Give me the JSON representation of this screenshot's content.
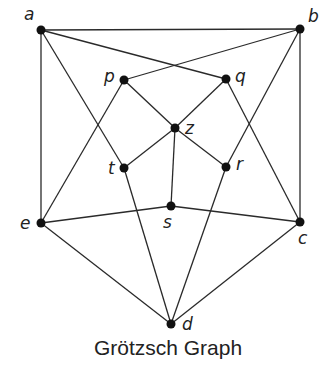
{
  "title": "Grötzsch Graph",
  "nodes": [
    {
      "id": "a",
      "x": 41,
      "y": 30,
      "lx": 24,
      "ly": 20
    },
    {
      "id": "b",
      "x": 300,
      "y": 29,
      "lx": 308,
      "ly": 22
    },
    {
      "id": "p",
      "x": 124,
      "y": 80,
      "lx": 104,
      "ly": 82
    },
    {
      "id": "q",
      "x": 226,
      "y": 79,
      "lx": 235,
      "ly": 82
    },
    {
      "id": "z",
      "x": 175,
      "y": 128,
      "lx": 185,
      "ly": 134
    },
    {
      "id": "t",
      "x": 124,
      "y": 168,
      "lx": 108,
      "ly": 174
    },
    {
      "id": "r",
      "x": 226,
      "y": 167,
      "lx": 236,
      "ly": 170
    },
    {
      "id": "s",
      "x": 171,
      "y": 206,
      "lx": 163,
      "ly": 228
    },
    {
      "id": "e",
      "x": 41,
      "y": 223,
      "lx": 20,
      "ly": 229
    },
    {
      "id": "c",
      "x": 300,
      "y": 222,
      "lx": 298,
      "ly": 244
    },
    {
      "id": "d",
      "x": 171,
      "y": 324,
      "lx": 182,
      "ly": 330
    }
  ],
  "edges": [
    [
      "a",
      "b"
    ],
    [
      "a",
      "e"
    ],
    [
      "a",
      "q"
    ],
    [
      "a",
      "t"
    ],
    [
      "b",
      "p"
    ],
    [
      "b",
      "c"
    ],
    [
      "b",
      "r"
    ],
    [
      "p",
      "z"
    ],
    [
      "p",
      "e"
    ],
    [
      "q",
      "z"
    ],
    [
      "q",
      "c"
    ],
    [
      "t",
      "z"
    ],
    [
      "t",
      "d"
    ],
    [
      "r",
      "z"
    ],
    [
      "r",
      "d"
    ],
    [
      "z",
      "s"
    ],
    [
      "e",
      "s"
    ],
    [
      "s",
      "c"
    ],
    [
      "e",
      "d"
    ],
    [
      "c",
      "d"
    ]
  ]
}
